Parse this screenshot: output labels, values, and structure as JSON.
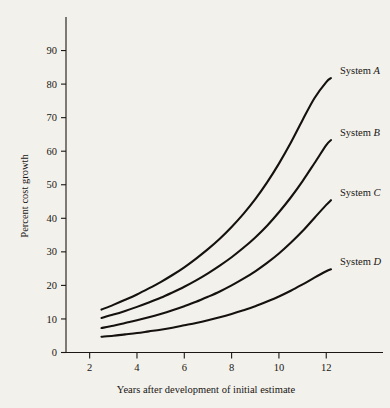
{
  "chart_data": {
    "type": "line",
    "title": "",
    "xlabel": "Years after development of initial estimate",
    "ylabel": "Percent cost growth",
    "xlim": [
      1.0,
      13.3
    ],
    "ylim": [
      0,
      100
    ],
    "xticks": [
      2,
      4,
      6,
      8,
      10,
      12
    ],
    "xtick_labels": [
      "2",
      "4",
      "6",
      "8",
      "10",
      "12"
    ],
    "yticks": [
      0,
      10,
      20,
      30,
      40,
      50,
      60,
      70,
      80,
      90
    ],
    "ytick_labels": [
      "0",
      "10",
      "20",
      "30",
      "40",
      "50",
      "60",
      "70",
      "80",
      "90"
    ],
    "grid": false,
    "legend_position": "right-of-curve-ends",
    "x": [
      2.5,
      3.0,
      3.5,
      4.0,
      4.5,
      5.0,
      5.5,
      6.0,
      6.5,
      7.0,
      7.5,
      8.0,
      8.5,
      9.0,
      9.5,
      10.0,
      10.5,
      11.0,
      11.5,
      12.0,
      12.2
    ],
    "series": [
      {
        "name": "System A",
        "label_prefix": "System ",
        "label_suffix": "A",
        "values": [
          12.8,
          14.2,
          15.7,
          17.3,
          19.1,
          21.0,
          23.1,
          25.4,
          28.0,
          30.8,
          33.9,
          37.4,
          41.3,
          45.7,
          50.7,
          56.3,
          62.5,
          69.3,
          75.8,
          80.6,
          81.8
        ],
        "end_value": 81.8,
        "start_value": 12.8
      },
      {
        "name": "System B",
        "label_prefix": "System ",
        "label_suffix": "B",
        "values": [
          10.3,
          11.3,
          12.4,
          13.6,
          14.9,
          16.3,
          17.9,
          19.6,
          21.5,
          23.6,
          25.9,
          28.4,
          31.2,
          34.3,
          37.8,
          41.8,
          46.2,
          51.1,
          56.4,
          61.8,
          63.3
        ],
        "end_value": 63.3,
        "start_value": 10.3
      },
      {
        "name": "System C",
        "label_prefix": "System ",
        "label_suffix": "C",
        "values": [
          7.3,
          8.0,
          8.8,
          9.6,
          10.5,
          11.5,
          12.6,
          13.8,
          15.1,
          16.6,
          18.2,
          20.0,
          22.0,
          24.2,
          26.7,
          29.5,
          32.7,
          36.2,
          40.1,
          44.0,
          45.4
        ],
        "end_value": 45.4,
        "start_value": 7.3
      },
      {
        "name": "System D",
        "label_prefix": "System ",
        "label_suffix": "D",
        "values": [
          4.7,
          5.0,
          5.4,
          5.8,
          6.3,
          6.8,
          7.4,
          8.1,
          8.8,
          9.6,
          10.5,
          11.5,
          12.6,
          13.8,
          15.2,
          16.7,
          18.4,
          20.3,
          22.3,
          24.2,
          24.8
        ],
        "end_value": 24.8,
        "start_value": 4.7
      }
    ],
    "colors": {
      "background": "#f3f1ec",
      "ink": "#14110e",
      "axis": "#1a1714"
    }
  },
  "labels": {
    "y_axis_title": "Percent cost growth",
    "x_axis_title": "Years after development of initial estimate",
    "series_a": "System A",
    "series_b": "System B",
    "series_c": "System C",
    "series_d": "System D"
  }
}
